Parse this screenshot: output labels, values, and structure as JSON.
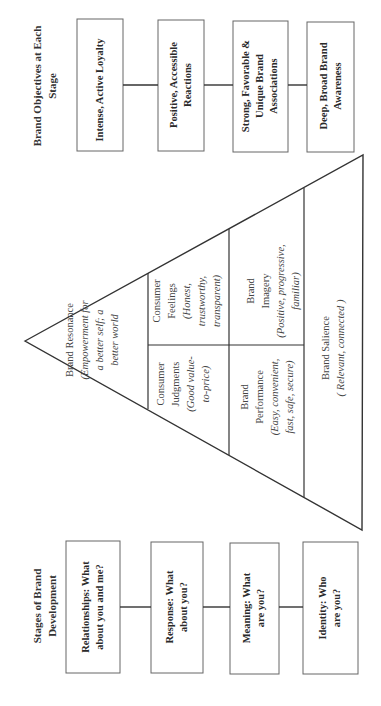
{
  "figure": {
    "orientation": "rotated -90deg (text reads bottom-to-top)",
    "objectives": {
      "heading": "Brand Objectives at Each Stage",
      "boxes": [
        {
          "label": "Intense, Active Loyalty"
        },
        {
          "label": "Positive, Accessible Reactions"
        },
        {
          "label": "Strong, Favorable & Unique Brand Associations"
        },
        {
          "label": "Deep, Broad Brand Awareness"
        }
      ]
    },
    "stages": {
      "heading": "Stages of Brand Development",
      "boxes": [
        {
          "label": "Relationships: What about you and me?"
        },
        {
          "label": "Response: What about you?"
        },
        {
          "label": "Meaning: What are you?"
        },
        {
          "label": "Identity: Who are you?"
        }
      ]
    },
    "pyramid": {
      "resonance": {
        "title": "Brand Resonance",
        "desc": "(Empowerment for a better self; a better world"
      },
      "feelings": {
        "title": "Consumer Feelings",
        "desc": "(Honest, trustworthy, transparent)"
      },
      "judgments": {
        "title": "Consumer Judgments",
        "desc": "(Good value-to-price)"
      },
      "imagery": {
        "title": "Brand Imagery",
        "desc": "(Positive, progressive, familiar)"
      },
      "performance": {
        "title": "Brand Performance",
        "desc": "(Easy, convenient, fast, safe, secure)"
      },
      "salience": {
        "title": "Brand Salience",
        "desc": "( Relevant, connected )"
      }
    },
    "colors": {
      "line": "#333333",
      "box_border": "#666666",
      "background": "#ffffff"
    }
  }
}
